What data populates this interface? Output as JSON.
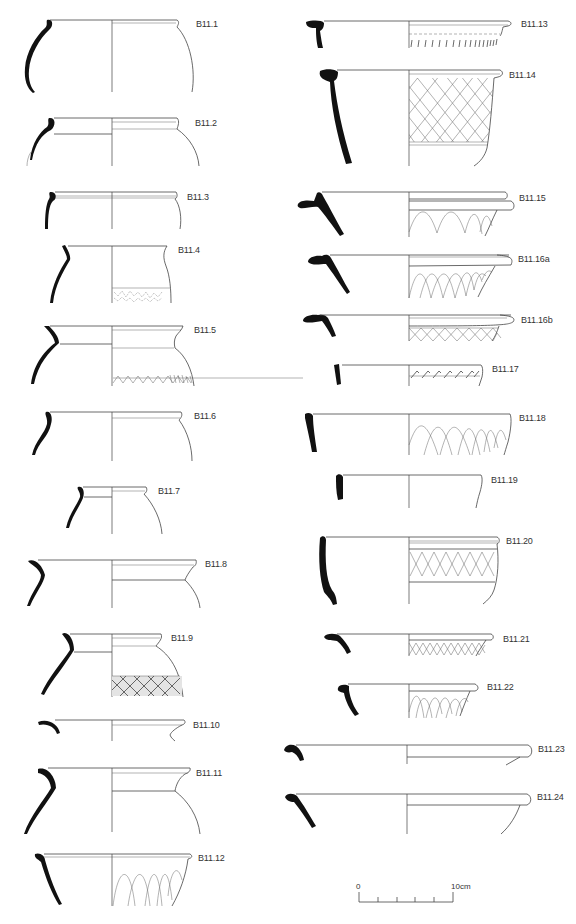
{
  "figure": {
    "type": "archaeological pottery profile drawings",
    "left_column": [
      {
        "id": "B11.1",
        "form": "jar",
        "decoration": "none"
      },
      {
        "id": "B11.2",
        "form": "jar",
        "decoration": "none"
      },
      {
        "id": "B11.3",
        "form": "jar",
        "decoration": "none"
      },
      {
        "id": "B11.4",
        "form": "jar",
        "decoration": "stippled band"
      },
      {
        "id": "B11.5",
        "form": "jar",
        "decoration": "zigzag band"
      },
      {
        "id": "B11.6",
        "form": "jar",
        "decoration": "none"
      },
      {
        "id": "B11.7",
        "form": "jar",
        "decoration": "none"
      },
      {
        "id": "B11.8",
        "form": "jar",
        "decoration": "none"
      },
      {
        "id": "B11.9",
        "form": "jar",
        "decoration": "cross-hatched band"
      },
      {
        "id": "B11.10",
        "form": "jar",
        "decoration": "none"
      },
      {
        "id": "B11.11",
        "form": "jar",
        "decoration": "none"
      },
      {
        "id": "B11.12",
        "form": "bowl",
        "decoration": "intersecting arcs"
      }
    ],
    "right_column": [
      {
        "id": "B11.13",
        "form": "bowl",
        "decoration": "oblique strokes"
      },
      {
        "id": "B11.14",
        "form": "bowl",
        "decoration": "lattice"
      },
      {
        "id": "B11.15",
        "form": "flanged bowl",
        "decoration": "arcs"
      },
      {
        "id": "B11.16a",
        "form": "flanged bowl",
        "decoration": "intersecting arcs"
      },
      {
        "id": "B11.16b",
        "form": "flanged bowl",
        "decoration": "lattice"
      },
      {
        "id": "B11.17",
        "form": "bowl",
        "decoration": "oblique strokes"
      },
      {
        "id": "B11.18",
        "form": "bowl",
        "decoration": "intersecting arcs"
      },
      {
        "id": "B11.19",
        "form": "bowl",
        "decoration": "none"
      },
      {
        "id": "B11.20",
        "form": "bowl",
        "decoration": "lattice band"
      },
      {
        "id": "B11.21",
        "form": "bowl",
        "decoration": "lattice"
      },
      {
        "id": "B11.22",
        "form": "bowl",
        "decoration": "intersecting arcs"
      },
      {
        "id": "B11.23",
        "form": "dish",
        "decoration": "none"
      },
      {
        "id": "B11.24",
        "form": "dish",
        "decoration": "none"
      }
    ],
    "scale_bar": {
      "start_label": "0",
      "end_label": "10cm",
      "divisions": 5
    }
  }
}
